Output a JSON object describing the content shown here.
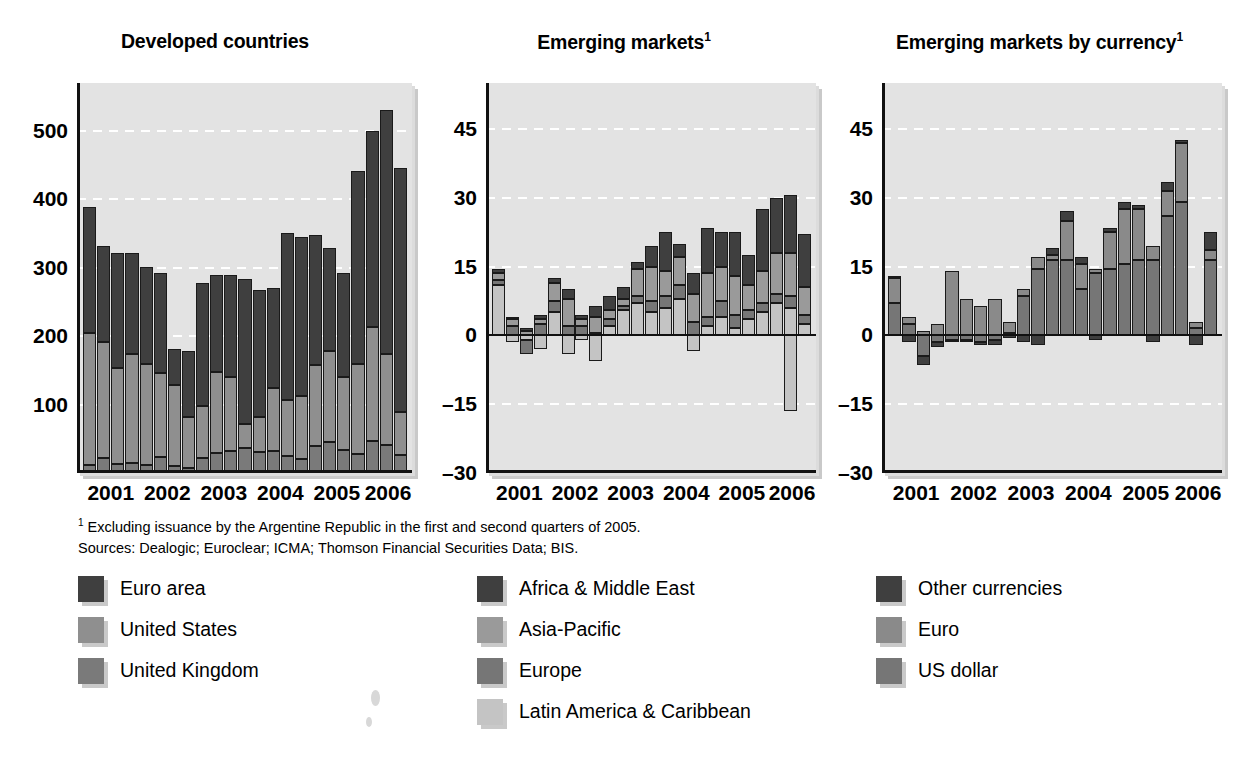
{
  "panels": [
    {
      "title": "Developed countries",
      "superscript": ""
    },
    {
      "title": "Emerging markets",
      "superscript": "1"
    },
    {
      "title": "Emerging markets by currency",
      "superscript": "1"
    }
  ],
  "notes": {
    "footnote_marker": "1",
    "footnote": " Excluding issuance by the Argentine Republic in the first and second quarters of 2005.",
    "sources": "Sources: Dealogic; Euroclear; ICMA; Thomson  Financial Securities Data; BIS."
  },
  "colors": {
    "dark": "#3f3f3f",
    "mid": "#7a7a7a",
    "midlight": "#8f8f8f",
    "light": "#c9c9c9",
    "plot_bg": "#e3e3e3",
    "axis": "#111111",
    "grid": "#ffffff"
  },
  "legends": [
    {
      "items": [
        {
          "label": "Euro area",
          "color": "#3f3f3f"
        },
        {
          "label": "United States",
          "color": "#8f8f8f"
        },
        {
          "label": "United Kingdom",
          "color": "#7a7a7a"
        }
      ]
    },
    {
      "items": [
        {
          "label": "Africa & Middle East",
          "color": "#3f3f3f"
        },
        {
          "label": "Asia-Pacific",
          "color": "#9a9a9a"
        },
        {
          "label": "Europe",
          "color": "#767676"
        },
        {
          "label": "Latin America & Caribbean",
          "color": "#c4c4c4"
        }
      ]
    },
    {
      "items": [
        {
          "label": "Other currencies",
          "color": "#3f3f3f"
        },
        {
          "label": "Euro",
          "color": "#8a8a8a"
        },
        {
          "label": "US dollar",
          "color": "#767676"
        }
      ]
    }
  ],
  "chart_data": [
    {
      "type": "bar",
      "subtype": "stacked",
      "title": "Developed countries",
      "xlabel": "",
      "ylabel": "",
      "ylim": [
        0,
        570
      ],
      "yticks": [
        100,
        200,
        300,
        400,
        500
      ],
      "grid": true,
      "legend_position": "below",
      "x": [
        "2001 Q1",
        "2001 Q2",
        "2001 Q3",
        "2001 Q4",
        "2002 Q1",
        "2002 Q2",
        "2002 Q3",
        "2002 Q4",
        "2003 Q1",
        "2003 Q2",
        "2003 Q3",
        "2003 Q4",
        "2004 Q1",
        "2004 Q2",
        "2004 Q3",
        "2004 Q4",
        "2005 Q1",
        "2005 Q2",
        "2005 Q3",
        "2005 Q4",
        "2006 Q1",
        "2006 Q2",
        "2006 Q3"
      ],
      "xtick_labels": [
        "2001",
        "2002",
        "2003",
        "2004",
        "2005",
        "2006"
      ],
      "series": [
        {
          "name": "United Kingdom",
          "color": "#7a7a7a",
          "values": [
            12,
            22,
            13,
            14,
            11,
            23,
            10,
            7,
            22,
            29,
            32,
            37,
            30,
            32,
            25,
            21,
            40,
            45,
            33,
            28,
            47,
            41,
            27
          ]
        },
        {
          "name": "United States",
          "color": "#8f8f8f",
          "values": [
            192,
            170,
            140,
            160,
            148,
            123,
            118,
            75,
            76,
            118,
            108,
            35,
            52,
            92,
            82,
            92,
            118,
            134,
            107,
            131,
            166,
            133,
            62
          ]
        },
        {
          "name": "Euro area",
          "color": "#3f3f3f",
          "values": [
            185,
            140,
            168,
            148,
            142,
            147,
            53,
            96,
            179,
            143,
            149,
            212,
            186,
            147,
            244,
            232,
            190,
            150,
            153,
            282,
            287,
            357,
            357
          ]
        }
      ],
      "totals": [
        389,
        332,
        321,
        322,
        301,
        293,
        181,
        178,
        277,
        290,
        289,
        284,
        268,
        271,
        351,
        345,
        348,
        329,
        293,
        441,
        500,
        531,
        446
      ]
    },
    {
      "type": "bar",
      "subtype": "stacked",
      "title": "Emerging markets",
      "footnote": "1",
      "xlabel": "",
      "ylabel": "",
      "ylim": [
        -30,
        55
      ],
      "yticks": [
        -30,
        -15,
        0,
        15,
        30,
        45
      ],
      "grid": true,
      "legend_position": "below",
      "x": [
        "2001 Q1",
        "2001 Q2",
        "2001 Q3",
        "2001 Q4",
        "2002 Q1",
        "2002 Q2",
        "2002 Q3",
        "2002 Q4",
        "2003 Q1",
        "2003 Q2",
        "2003 Q3",
        "2003 Q4",
        "2004 Q1",
        "2004 Q2",
        "2004 Q3",
        "2004 Q4",
        "2005 Q1",
        "2005 Q2",
        "2005 Q3",
        "2005 Q4",
        "2006 Q1",
        "2006 Q2",
        "2006 Q3"
      ],
      "xtick_labels": [
        "2001",
        "2002",
        "2003",
        "2004",
        "2005",
        "2006"
      ],
      "series": [
        {
          "name": "Latin America & Caribbean",
          "color": "#c4c4c4",
          "values": [
            11.0,
            -1.5,
            -1.0,
            -3.0,
            5.0,
            -4.0,
            -1.0,
            -5.5,
            2.0,
            5.5,
            7.0,
            5.0,
            6.0,
            8.0,
            -3.5,
            2.0,
            4.0,
            1.5,
            3.5,
            5.0,
            7.0,
            6.0,
            2.5
          ]
        },
        {
          "name": "Europe",
          "color": "#767676",
          "values": [
            1.0,
            2.0,
            -3.0,
            2.5,
            2.5,
            2.0,
            2.0,
            0.5,
            1.5,
            1.0,
            1.5,
            2.5,
            2.5,
            3.0,
            3.0,
            2.0,
            3.5,
            3.0,
            2.0,
            2.0,
            2.0,
            2.5,
            2.0
          ]
        },
        {
          "name": "Asia-Pacific",
          "color": "#9a9a9a",
          "values": [
            1.5,
            1.5,
            1.0,
            1.0,
            4.0,
            6.0,
            1.5,
            3.5,
            2.0,
            1.5,
            6.0,
            7.5,
            5.5,
            6.0,
            6.0,
            9.5,
            7.5,
            8.5,
            5.5,
            7.0,
            9.0,
            9.5,
            6.0
          ]
        },
        {
          "name": "Africa & Middle East",
          "color": "#3f3f3f",
          "values": [
            1.0,
            0.5,
            0.5,
            1.0,
            1.0,
            2.0,
            1.0,
            2.5,
            3.0,
            2.5,
            1.5,
            4.5,
            8.5,
            3.0,
            4.5,
            10.0,
            7.5,
            9.5,
            6.5,
            13.5,
            12.0,
            12.5,
            11.5
          ]
        }
      ],
      "negative_note": "2006 Q2 shows a large negative Latin America & Caribbean bar of about -16",
      "totals_positive": [
        14.5,
        4.0,
        1.5,
        4.5,
        12.0,
        10.0,
        4.5,
        6.5,
        8.5,
        10.5,
        16.0,
        19.5,
        26.0,
        20.0,
        13.5,
        23.5,
        22.5,
        22.5,
        17.5,
        27.5,
        30.0,
        30.5,
        22.0
      ]
    },
    {
      "type": "bar",
      "subtype": "stacked",
      "title": "Emerging markets by currency",
      "footnote": "1",
      "xlabel": "",
      "ylabel": "",
      "ylim": [
        -30,
        55
      ],
      "yticks": [
        -30,
        -15,
        0,
        15,
        30,
        45
      ],
      "grid": true,
      "legend_position": "below",
      "x": [
        "2001 Q1",
        "2001 Q2",
        "2001 Q3",
        "2001 Q4",
        "2002 Q1",
        "2002 Q2",
        "2002 Q3",
        "2002 Q4",
        "2003 Q1",
        "2003 Q2",
        "2003 Q3",
        "2003 Q4",
        "2004 Q1",
        "2004 Q2",
        "2004 Q3",
        "2004 Q4",
        "2005 Q1",
        "2005 Q2",
        "2005 Q3",
        "2005 Q4",
        "2006 Q1",
        "2006 Q2",
        "2006 Q3"
      ],
      "xtick_labels": [
        "2001",
        "2002",
        "2003",
        "2004",
        "2005",
        "2006"
      ],
      "series": [
        {
          "name": "US dollar",
          "color": "#767676",
          "values": [
            7.0,
            2.5,
            -4.5,
            -1.5,
            -1.0,
            -1.0,
            -1.5,
            -1.0,
            0.5,
            8.5,
            14.5,
            16.5,
            16.5,
            10.0,
            13.5,
            14.5,
            15.5,
            16.5,
            16.5,
            26.0,
            29.0,
            1.5,
            16.5
          ]
        },
        {
          "name": "Euro",
          "color": "#8a8a8a",
          "values": [
            5.5,
            1.5,
            1.0,
            2.5,
            14.0,
            8.0,
            6.5,
            8.0,
            2.5,
            1.5,
            2.5,
            1.0,
            8.5,
            5.5,
            1.0,
            8.0,
            12.0,
            11.0,
            3.0,
            5.5,
            13.0,
            1.5,
            2.0
          ]
        },
        {
          "name": "Other currencies",
          "color": "#3f3f3f",
          "values": [
            0.5,
            -1.5,
            -2.0,
            -1.0,
            -0.5,
            -0.5,
            -0.5,
            -1.0,
            -0.5,
            -1.5,
            -2.0,
            1.5,
            2.0,
            1.5,
            -1.0,
            1.0,
            1.5,
            1.0,
            -1.5,
            2.0,
            0.5,
            -2.0,
            4.0
          ]
        }
      ],
      "totals_positive": [
        13.0,
        4.0,
        1.0,
        2.5,
        14.0,
        8.0,
        6.5,
        8.0,
        3.0,
        10.0,
        17.0,
        17.5,
        27.0,
        16.0,
        14.5,
        22.5,
        29.5,
        28.5,
        19.5,
        33.5,
        43.0,
        3.0,
        22.5
      ]
    }
  ]
}
